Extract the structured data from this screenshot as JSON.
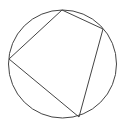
{
  "diagram": {
    "type": "inscribed-quadrilateral",
    "stroke_color": "#444444",
    "background": "#ffffff",
    "circle": {
      "cx": 62.5,
      "cy": 64,
      "r": 54
    },
    "vertices": [
      {
        "name": "top",
        "x": 62,
        "y": 10
      },
      {
        "name": "right",
        "x": 103,
        "y": 29
      },
      {
        "name": "bottom",
        "x": 79,
        "y": 117
      },
      {
        "name": "left",
        "x": 9,
        "y": 59
      }
    ]
  }
}
